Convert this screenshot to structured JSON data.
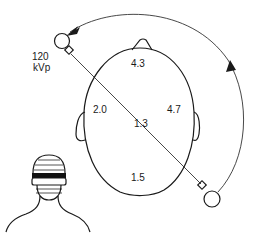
{
  "diagram": {
    "title": "",
    "tube_setting": {
      "line1": "120",
      "line2": "kVp"
    },
    "dose_values": {
      "anterior": "4.3",
      "left_lateral": "2.0",
      "center": "1.3",
      "right_lateral": "4.7",
      "posterior": "1.5"
    },
    "elements": [
      "x-ray tube (start position)",
      "x-ray tube (end position)",
      "rotation arc with arrows",
      "beam path line",
      "head cross-section (axial) with nose and ears",
      "patient bust with banded scan region"
    ],
    "colors": {
      "line": "#1a1a1a",
      "background": "#ffffff",
      "band": "#111111"
    }
  }
}
